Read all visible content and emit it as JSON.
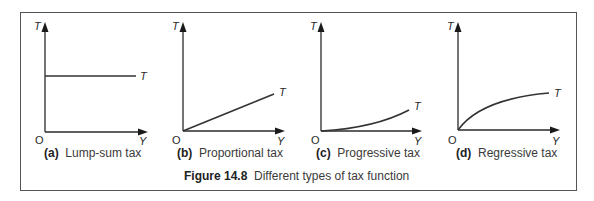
{
  "figure": {
    "number_label": "Figure 14.8",
    "title": "Different types of tax function"
  },
  "panels": [
    {
      "id": "a",
      "tag": "(a)",
      "title": "Lump-sum tax",
      "y_axis_label": "T",
      "x_axis_label": "Y",
      "origin_label": "O",
      "curve_label": "T",
      "shape": "horizontal"
    },
    {
      "id": "b",
      "tag": "(b)",
      "title": "Proportional tax",
      "y_axis_label": "T",
      "x_axis_label": "Y",
      "origin_label": "O",
      "curve_label": "T",
      "shape": "linear"
    },
    {
      "id": "c",
      "tag": "(c)",
      "title": "Progressive tax",
      "y_axis_label": "T",
      "x_axis_label": "Y",
      "origin_label": "O",
      "curve_label": "T",
      "shape": "convex"
    },
    {
      "id": "d",
      "tag": "(d)",
      "title": "Regressive tax",
      "y_axis_label": "T",
      "x_axis_label": "Y",
      "origin_label": "O",
      "curve_label": "T",
      "shape": "concave"
    }
  ],
  "colors": {
    "line": "#333333",
    "frame": "#555555",
    "text": "#2a2a2a"
  }
}
